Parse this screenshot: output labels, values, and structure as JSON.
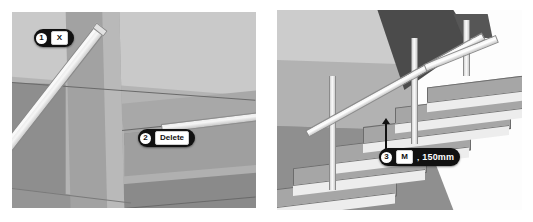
{
  "page": {
    "background": "#ffffff"
  },
  "panels": [
    {
      "id": "left",
      "name": "viewport-left",
      "description": "3D view from beneath the stair showing a diagonal handrail selected",
      "callouts": [
        {
          "step": "1",
          "key": "X",
          "label": "",
          "value": ""
        },
        {
          "step": "2",
          "key": "",
          "label": "Delete",
          "value": ""
        }
      ]
    },
    {
      "id": "right",
      "name": "viewport-right",
      "description": "3D view of the stair flight with railing and a vertical offset measurement",
      "callouts": [
        {
          "step": "3",
          "key": "M",
          "label": "",
          "value": "150mm"
        }
      ]
    }
  ],
  "callout_1": {
    "step": "1",
    "key": "X"
  },
  "callout_2": {
    "step": "2",
    "label": "Delete"
  },
  "callout_3": {
    "step": "3",
    "key": "M",
    "separator": ",",
    "value": "150mm"
  },
  "colors": {
    "badge_background": "#111111",
    "badge_text": "#ffffff",
    "key_background": "#ffffff",
    "key_text": "#111111",
    "scene_base": "#9a9a9a",
    "scene_sky": "#c9c9c9",
    "scene_floor": "#8f8f8f",
    "rail_highlight": "#f6f6f6",
    "soffit_dark": "#4b4b4b",
    "void_white": "#fdfdfd"
  }
}
